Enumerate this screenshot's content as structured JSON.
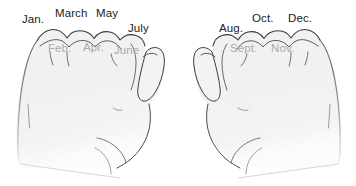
{
  "figure": {
    "background_color": "#ffffff",
    "ink_color": "#2b2b2b",
    "hand_fill_color": "#f1f1f1",
    "knuckle_label_color": "#1b1b1b",
    "valley_label_color": "#a9aaac"
  },
  "left_hand": {
    "name": "left-fist",
    "knuckle_labels": [
      {
        "text": "Jan.",
        "x": 22,
        "y": 14
      },
      {
        "text": "March",
        "x": 55,
        "y": 8
      },
      {
        "text": "May",
        "x": 96,
        "y": 8
      },
      {
        "text": "July",
        "x": 128,
        "y": 23
      }
    ],
    "valley_labels": [
      {
        "text": "Feb.",
        "x": 48,
        "y": 43
      },
      {
        "text": "Apr.",
        "x": 83,
        "y": 42
      },
      {
        "text": "June",
        "x": 114,
        "y": 45
      }
    ],
    "ghost_labels": [
      {
        "text": "",
        "x": 140,
        "y": 2
      }
    ]
  },
  "right_hand": {
    "name": "right-fist",
    "knuckle_labels": [
      {
        "text": "Aug.",
        "x": 219,
        "y": 23
      },
      {
        "text": "Oct.",
        "x": 252,
        "y": 13
      },
      {
        "text": "Dec.",
        "x": 288,
        "y": 13
      }
    ],
    "valley_labels": [
      {
        "text": "Sept.",
        "x": 230,
        "y": 43
      },
      {
        "text": "Nov.",
        "x": 271,
        "y": 43
      }
    ]
  }
}
